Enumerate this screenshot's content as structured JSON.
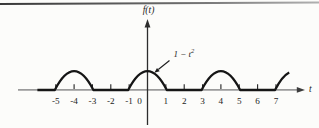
{
  "figure": {
    "y_axis_label": "f(t)",
    "x_axis_label": "t",
    "annotation_base": "1 − t",
    "annotation_sup": "2"
  },
  "axis": {
    "tick_labels": [
      "-5",
      "-4",
      "-3",
      "-2",
      "-1",
      "0",
      "1",
      "2",
      "3",
      "4",
      "5",
      "6",
      "7"
    ],
    "tick_values": [
      -5,
      -4,
      -3,
      -2,
      -1,
      0,
      1,
      2,
      3,
      4,
      5,
      6,
      7
    ]
  },
  "chart_data": {
    "type": "line",
    "title": "",
    "xlabel": "t",
    "ylabel": "f(t)",
    "annotation": "1 − t²",
    "x_tick_labels": [
      "-5",
      "-4",
      "-3",
      "-2",
      "-1",
      "0",
      "1",
      "2",
      "3",
      "4",
      "5",
      "6",
      "7"
    ],
    "xlim": [
      -7,
      8.6
    ],
    "ylim": [
      0,
      1
    ],
    "function_rule": "f(t) = 1 − t² for −1 ≤ t ≤ 1; f(t) = 0 for 1 ≤ t ≤ 3; periodic with period 4",
    "pulse_centers": [
      -4,
      0,
      4,
      8
    ],
    "pulse_half_width": 1,
    "peak_value": 1,
    "zero_value_intervals": [
      [
        -6,
        -5
      ],
      [
        -3,
        -1
      ],
      [
        1,
        3
      ],
      [
        5,
        7
      ]
    ],
    "visible_t_range": [
      -6,
      7.72
    ]
  },
  "colors": {
    "curve": "#151515",
    "h_axis": "#9b9b9b",
    "v_axis": "#2d2d2d",
    "tick": "#222222",
    "text": "#1c1c1c",
    "rule_dark": "#383838",
    "rule_light": "#b0b0b0"
  }
}
